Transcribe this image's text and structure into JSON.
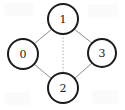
{
  "diagram": {
    "type": "undirected-graph",
    "title": "",
    "background_color": "#ffffff",
    "node_fill_color": "#ffffff",
    "node_stroke_color": "#1b1b1b",
    "edge_color": "#8d8d8d",
    "dotted_edge_color": "#a8a8a8",
    "label_color": "#222222",
    "node_radius": 15,
    "nodes": [
      {
        "id": "0",
        "label": "0",
        "cx": 23,
        "cy": 54,
        "position": "left"
      },
      {
        "id": "1",
        "label": "1",
        "cx": 63,
        "cy": 19,
        "position": "top"
      },
      {
        "id": "2",
        "label": "2",
        "cx": 63,
        "cy": 88,
        "position": "bottom"
      },
      {
        "id": "3",
        "label": "3",
        "cx": 102,
        "cy": 53,
        "position": "right"
      }
    ],
    "edges": [
      {
        "from": "0",
        "to": "1",
        "style": "solid",
        "x1": 34,
        "y1": 44,
        "x2": 52,
        "y2": 29
      },
      {
        "from": "1",
        "to": "3",
        "style": "solid",
        "x1": 74,
        "y1": 29,
        "x2": 92,
        "y2": 43
      },
      {
        "from": "0",
        "to": "2",
        "style": "solid",
        "x1": 34,
        "y1": 64,
        "x2": 52,
        "y2": 79
      },
      {
        "from": "2",
        "to": "3",
        "style": "solid",
        "x1": 74,
        "y1": 79,
        "x2": 92,
        "y2": 63
      },
      {
        "from": "1",
        "to": "2",
        "style": "dotted",
        "x1": 63,
        "y1": 34,
        "x2": 63,
        "y2": 73
      }
    ]
  }
}
